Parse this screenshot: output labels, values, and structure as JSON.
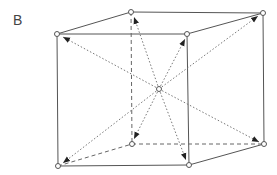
{
  "figure": {
    "label": "B",
    "vertices": {
      "back_top_left": [
        131,
        12
      ],
      "back_top_right": [
        263,
        13
      ],
      "front_top_left": [
        57,
        34
      ],
      "front_top_right": [
        187,
        34
      ],
      "back_bottom_left": [
        132,
        144
      ],
      "back_bottom_right": [
        264,
        144
      ],
      "front_bottom_left": [
        58,
        166
      ],
      "front_bottom_right": [
        189,
        165
      ],
      "center": [
        159,
        89
      ]
    },
    "colors": {
      "line": "#555555",
      "dotted": "#777777",
      "node_fill": "#ffffff"
    }
  }
}
